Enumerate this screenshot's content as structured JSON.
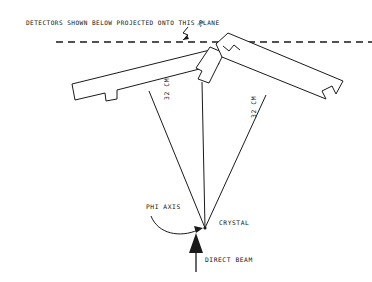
{
  "figure": {
    "title_note": "DETECTORS SHOWN BELOW PROJECTED ONTO THIS PLANE",
    "background_color": "#ffffff",
    "ink_color": "#1a1a1a"
  },
  "labels": {
    "plane_note": "DETECTORS SHOWN BELOW PROJECTED ONTO THIS PLANE",
    "distance_left": "32 CM",
    "distance_right": "32 CM",
    "phi_axis": "PHI AXIS",
    "crystal": "CRYSTAL",
    "direct_beam": "DIRECT BEAM",
    "apex_tick": "2Q"
  },
  "components": {
    "detector_left": "detector-bar-left",
    "detector_center": "detector-bar-center",
    "detector_right": "detector-bar-right",
    "projection_plane": "horizontal-dashed-plane-line",
    "ray_left": "ray-crystal-to-left-detector",
    "ray_center": "ray-crystal-to-center-detector",
    "ray_right": "ray-crystal-to-right-detector",
    "beam_arrow": "direct-beam-arrow-upward",
    "phi_arrow": "phi-axis-curved-pointer"
  },
  "geometry": {
    "crystal_point": "205,228",
    "plane_y": "42",
    "detector_distance_cm": "32"
  }
}
